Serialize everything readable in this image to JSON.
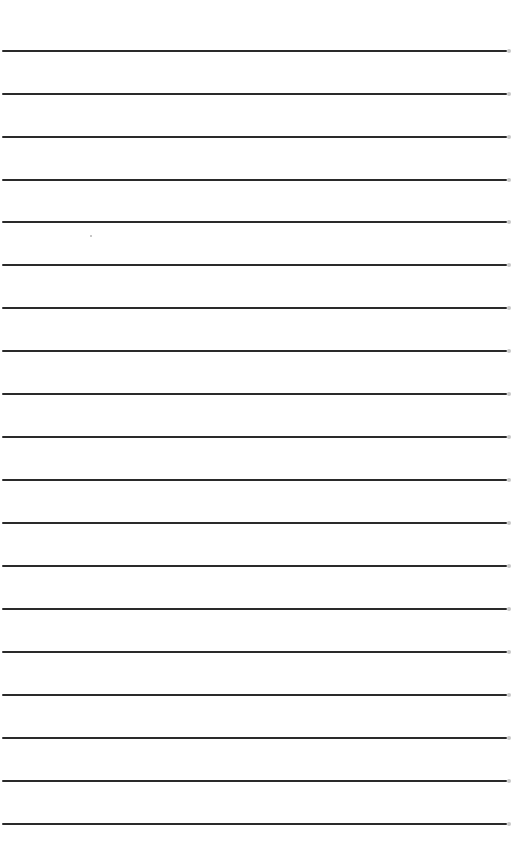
{
  "page": {
    "type": "ruled-paper",
    "width": 512,
    "height": 868,
    "background_color": "#ffffff",
    "line_color": "#2a2a2a",
    "line_count": 19,
    "line_spacing_px": 43,
    "lines_y": [
      51,
      94,
      137,
      180,
      222,
      265,
      308,
      351,
      394,
      437,
      480,
      523,
      566,
      609,
      652,
      695,
      738,
      781,
      824
    ]
  }
}
